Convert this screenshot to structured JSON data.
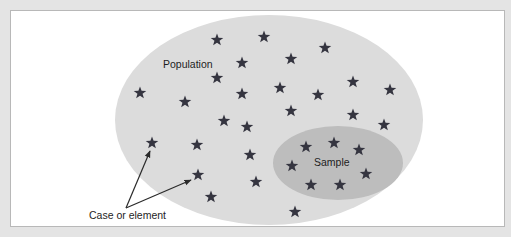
{
  "colors": {
    "background": "#e4e4e4",
    "panel": "#ffffff",
    "panel_border": "#b8b8b8",
    "population_fill": "#dcdcdc",
    "sample_fill": "#bdbdbd",
    "star": "#353540",
    "arrow": "#2a2a2a",
    "text": "#1e1e1e"
  },
  "labels": {
    "population": "Population",
    "sample": "Sample",
    "case_or_element": "Case or element"
  },
  "population": {
    "cx": 269,
    "cy": 120,
    "rx": 154,
    "ry": 105
  },
  "sample": {
    "cx": 338,
    "cy": 163,
    "rx": 65,
    "ry": 37
  },
  "icons": {
    "element": "star-icon"
  },
  "population_stars": [
    [
      217,
      40
    ],
    [
      264,
      37
    ],
    [
      242,
      63
    ],
    [
      291,
      59
    ],
    [
      325,
      48
    ],
    [
      140,
      93
    ],
    [
      185,
      102
    ],
    [
      217,
      78
    ],
    [
      242,
      94
    ],
    [
      280,
      88
    ],
    [
      318,
      95
    ],
    [
      353,
      82
    ],
    [
      390,
      90
    ],
    [
      291,
      111
    ],
    [
      224,
      121
    ],
    [
      247,
      127
    ],
    [
      353,
      115
    ],
    [
      384,
      125
    ],
    [
      152,
      143
    ],
    [
      197,
      145
    ],
    [
      250,
      155
    ],
    [
      198,
      175
    ],
    [
      211,
      197
    ],
    [
      256,
      182
    ],
    [
      295,
      212
    ]
  ],
  "sample_stars": [
    [
      306,
      147
    ],
    [
      334,
      143
    ],
    [
      359,
      150
    ],
    [
      292,
      166
    ],
    [
      366,
      174
    ],
    [
      311,
      185
    ],
    [
      340,
      185
    ]
  ],
  "arrows": [
    {
      "from": [
        126,
        208
      ],
      "to": [
        150,
        151
      ]
    },
    {
      "from": [
        126,
        208
      ],
      "to": [
        191,
        180
      ]
    }
  ]
}
